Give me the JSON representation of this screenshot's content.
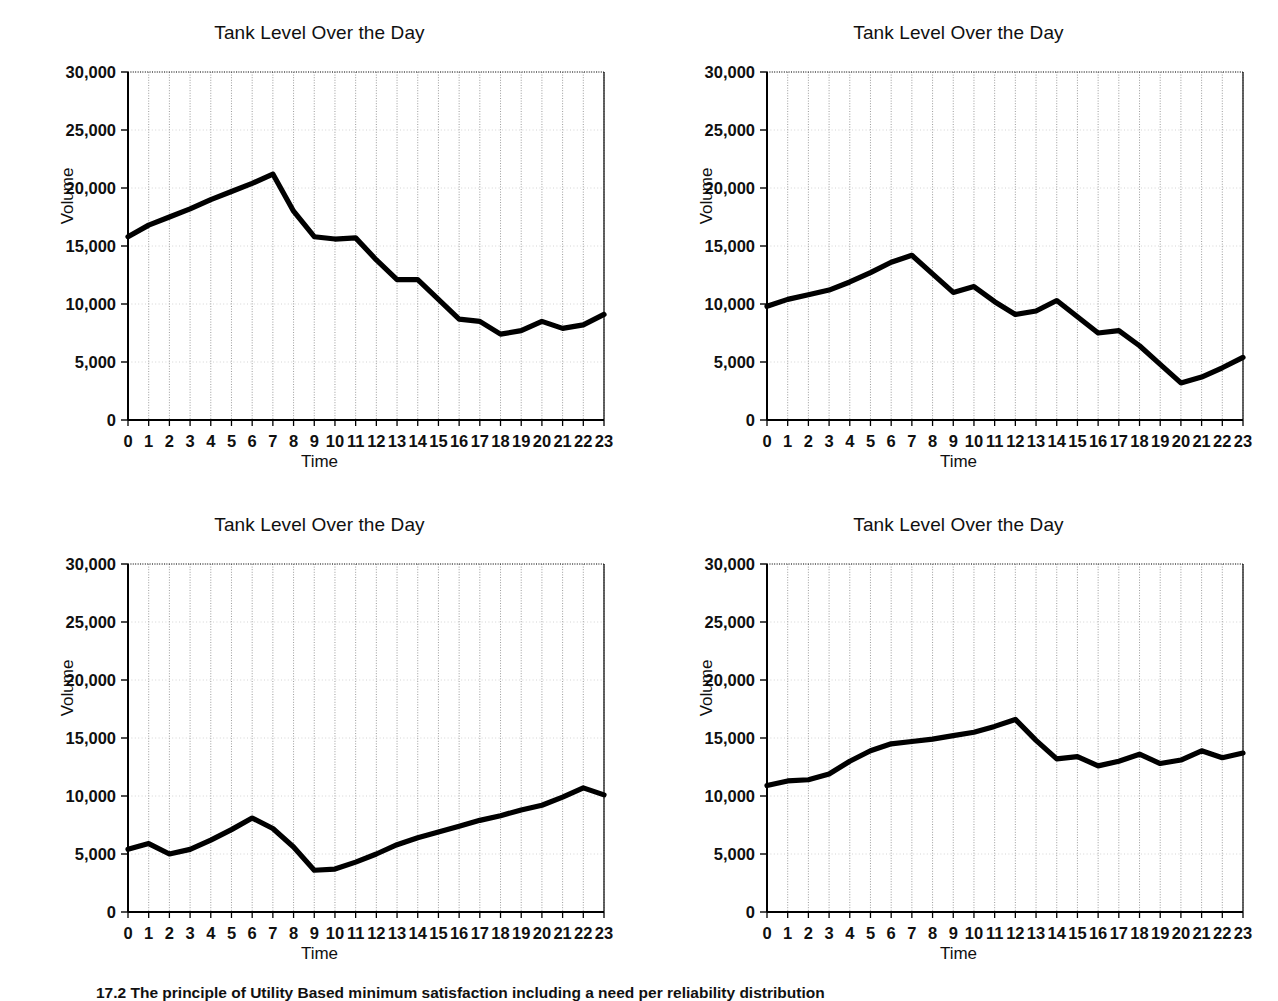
{
  "page": {
    "caption": "17.2  The principle of Utility Based minimum satisfaction including a need per reliability distribution"
  },
  "axis": {
    "y_label": "Volume",
    "x_label": "Time",
    "y_ticks": [
      "0",
      "5,000",
      "10,000",
      "15,000",
      "20,000",
      "25,000",
      "30,000"
    ],
    "x_ticks": [
      "0",
      "1",
      "2",
      "3",
      "4",
      "5",
      "6",
      "7",
      "8",
      "9",
      "10",
      "11",
      "12",
      "13",
      "14",
      "15",
      "16",
      "17",
      "18",
      "19",
      "20",
      "21",
      "22",
      "23"
    ]
  },
  "style": {
    "line_color": "#000000",
    "grid_color": "#8a8a8a",
    "axis_color": "#000000",
    "background": "#ffffff"
  },
  "chart_data": [
    {
      "id": "chart-top-left",
      "type": "line",
      "title": "Tank Level Over the Day",
      "xlabel": "Time",
      "ylabel": "Volume",
      "x": [
        0,
        1,
        2,
        3,
        4,
        5,
        6,
        7,
        8,
        9,
        10,
        11,
        12,
        13,
        14,
        15,
        16,
        17,
        18,
        19,
        20,
        21,
        22,
        23
      ],
      "values": [
        15800,
        16800,
        17500,
        18200,
        19000,
        19700,
        20400,
        21200,
        18000,
        15800,
        15600,
        15700,
        13800,
        12100,
        12100,
        10400,
        8700,
        8500,
        7400,
        7700,
        8500,
        7900,
        8200,
        9100
      ],
      "ylim": [
        0,
        30000
      ],
      "yticks": [
        0,
        5000,
        10000,
        15000,
        20000,
        25000,
        30000
      ],
      "grid": true,
      "legend": null
    },
    {
      "id": "chart-top-right",
      "type": "line",
      "title": "Tank Level Over the Day",
      "xlabel": "Time",
      "ylabel": "Volume",
      "x": [
        0,
        1,
        2,
        3,
        4,
        5,
        6,
        7,
        8,
        9,
        10,
        11,
        12,
        13,
        14,
        15,
        16,
        17,
        18,
        19,
        20,
        21,
        22,
        23
      ],
      "values": [
        9800,
        10400,
        10800,
        11200,
        11900,
        12700,
        13600,
        14200,
        12600,
        11000,
        11500,
        10200,
        9100,
        9400,
        10300,
        8900,
        7500,
        7700,
        6400,
        4800,
        3200,
        3700,
        4500,
        5400
      ],
      "ylim": [
        0,
        30000
      ],
      "yticks": [
        0,
        5000,
        10000,
        15000,
        20000,
        25000,
        30000
      ],
      "grid": true,
      "legend": null
    },
    {
      "id": "chart-bottom-left",
      "type": "line",
      "title": "Tank Level Over the Day",
      "xlabel": "Time",
      "ylabel": "Volume",
      "x": [
        0,
        1,
        2,
        3,
        4,
        5,
        6,
        7,
        8,
        9,
        10,
        11,
        12,
        13,
        14,
        15,
        16,
        17,
        18,
        19,
        20,
        21,
        22,
        23
      ],
      "values": [
        5400,
        5900,
        5000,
        5400,
        6200,
        7100,
        8100,
        7200,
        5600,
        3600,
        3700,
        4300,
        5000,
        5800,
        6400,
        6900,
        7400,
        7900,
        8300,
        8800,
        9200,
        9900,
        10700,
        10100
      ],
      "ylim": [
        0,
        30000
      ],
      "yticks": [
        0,
        5000,
        10000,
        15000,
        20000,
        25000,
        30000
      ],
      "grid": true,
      "legend": null
    },
    {
      "id": "chart-bottom-right",
      "type": "line",
      "title": "Tank Level Over the Day",
      "xlabel": "Time",
      "ylabel": "Volume",
      "x": [
        0,
        1,
        2,
        3,
        4,
        5,
        6,
        7,
        8,
        9,
        10,
        11,
        12,
        13,
        14,
        15,
        16,
        17,
        18,
        19,
        20,
        21,
        22,
        23
      ],
      "values": [
        10900,
        11300,
        11400,
        11900,
        13000,
        13900,
        14500,
        14700,
        14900,
        15200,
        15500,
        16000,
        16600,
        14800,
        13200,
        13400,
        12600,
        13000,
        13600,
        12800,
        13100,
        13900,
        13300,
        13700
      ],
      "ylim": [
        0,
        30000
      ],
      "yticks": [
        0,
        5000,
        10000,
        15000,
        20000,
        25000,
        30000
      ],
      "grid": true,
      "legend": null
    }
  ]
}
